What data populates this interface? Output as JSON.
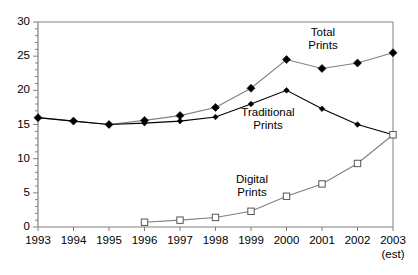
{
  "chart_data": {
    "type": "line",
    "title": "",
    "xlabel": "",
    "ylabel": "",
    "categories": [
      "1993",
      "1994",
      "1995",
      "1996",
      "1997",
      "1998",
      "1999",
      "2000",
      "2001",
      "2002",
      "2003"
    ],
    "xtick_note": "(est)",
    "xlim": [
      1993,
      2003
    ],
    "ylim": [
      0,
      30
    ],
    "yticks": [
      0,
      5,
      10,
      15,
      20,
      25,
      30
    ],
    "grid": false,
    "legend": "inline-annotations",
    "series": [
      {
        "name": "Total Prints",
        "marker": "filled-diamond",
        "color": "#808080",
        "values": [
          16,
          15.5,
          15,
          15.6,
          16.3,
          17.5,
          20.3,
          24.5,
          23.2,
          24,
          25.5
        ]
      },
      {
        "name": "Traditional Prints",
        "marker": "filled-diamond-small",
        "color": "#000000",
        "values": [
          16,
          15.5,
          15,
          15.2,
          15.5,
          16.1,
          18,
          20,
          17.3,
          15,
          13.5
        ]
      },
      {
        "name": "Digital Prints",
        "marker": "open-square",
        "color": "#808080",
        "values": [
          null,
          null,
          null,
          0.7,
          1.0,
          1.4,
          2.3,
          4.5,
          6.3,
          9.3,
          13.5
        ]
      }
    ],
    "annotations": [
      {
        "text": "Total",
        "x": 323,
        "y": 36
      },
      {
        "text": "Prints",
        "x": 323,
        "y": 49
      },
      {
        "text": "Traditional",
        "x": 268,
        "y": 116
      },
      {
        "text": "Prints",
        "x": 268,
        "y": 129
      },
      {
        "text": "Digital",
        "x": 252,
        "y": 183
      },
      {
        "text": "Prints",
        "x": 252,
        "y": 196
      }
    ]
  },
  "axes": {
    "y_tick_labels": [
      "30",
      "25",
      "20",
      "15",
      "10",
      "5",
      "0"
    ],
    "x_tick_labels": [
      "1993",
      "1994",
      "1995",
      "1996",
      "1997",
      "1998",
      "1999",
      "2000",
      "2001",
      "2002",
      "2003"
    ],
    "est_note": "(est)"
  },
  "colors": {
    "axis": "#808080",
    "total_line": "#808080",
    "traditional_line": "#000000",
    "digital_line": "#808080",
    "background": "#ffffff"
  }
}
